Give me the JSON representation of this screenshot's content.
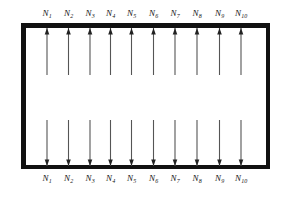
{
  "figure": {
    "type": "engineering-schematic",
    "background_color": "#ffffff",
    "frame": {
      "name": "rectangle-frame",
      "stroke_color": "#111111",
      "fill_color": "#ffffff",
      "x": 21,
      "y": 23,
      "width": 249,
      "height": 146,
      "border_thickness": 4.5
    },
    "arrows": {
      "stroke_color": "#555555",
      "head_color": "#222222",
      "columns_x": [
        47,
        68.5,
        90,
        110.5,
        131.5,
        153.5,
        175,
        197,
        219.5,
        241
      ],
      "top_group": {
        "name": "top-arrow-group",
        "direction": "up",
        "count": 10,
        "tail_y": 75,
        "head_y": 28
      },
      "bottom_group": {
        "name": "bottom-arrow-group",
        "direction": "down",
        "count": 10,
        "tail_y": 120,
        "head_y": 166
      }
    },
    "top_labels": [
      {
        "base": "N",
        "sub": "1",
        "x": 47,
        "y": 9
      },
      {
        "base": "N",
        "sub": "2",
        "x": 68.5,
        "y": 9
      },
      {
        "base": "N",
        "sub": "3",
        "x": 90,
        "y": 9
      },
      {
        "base": "N",
        "sub": "4",
        "x": 110.5,
        "y": 9
      },
      {
        "base": "N",
        "sub": "5",
        "x": 131.5,
        "y": 9
      },
      {
        "base": "N",
        "sub": "6",
        "x": 153.5,
        "y": 9
      },
      {
        "base": "N",
        "sub": "7",
        "x": 175,
        "y": 9
      },
      {
        "base": "N",
        "sub": "8",
        "x": 197,
        "y": 9
      },
      {
        "base": "N",
        "sub": "9",
        "x": 219.5,
        "y": 9
      },
      {
        "base": "N",
        "sub": "10",
        "x": 241,
        "y": 9
      }
    ],
    "bottom_labels": [
      {
        "base": "N",
        "sub": "1",
        "x": 47,
        "y": 174
      },
      {
        "base": "N",
        "sub": "2",
        "x": 68.5,
        "y": 174
      },
      {
        "base": "N",
        "sub": "3",
        "x": 90,
        "y": 174
      },
      {
        "base": "N",
        "sub": "4",
        "x": 110.5,
        "y": 174
      },
      {
        "base": "N",
        "sub": "5",
        "x": 131.5,
        "y": 174
      },
      {
        "base": "N",
        "sub": "6",
        "x": 153.5,
        "y": 174
      },
      {
        "base": "N",
        "sub": "7",
        "x": 175,
        "y": 174
      },
      {
        "base": "N",
        "sub": "8",
        "x": 197,
        "y": 174
      },
      {
        "base": "N",
        "sub": "9",
        "x": 219.5,
        "y": 174
      },
      {
        "base": "N",
        "sub": "10",
        "x": 241,
        "y": 174
      }
    ]
  }
}
